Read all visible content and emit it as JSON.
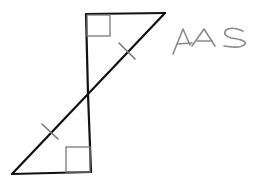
{
  "diagram": {
    "type": "two right triangles sharing a vertex (vertical angles)",
    "label": "AAS",
    "colors": {
      "edges": "#111111",
      "right_angle_marks": "#7a7a7a",
      "congruence_ticks": "#777777",
      "label": "#8a8a8a"
    },
    "triangles": [
      {
        "name": "top-triangle",
        "vertices": [
          [
            86,
            14
          ],
          [
            165,
            13
          ],
          [
            88,
            94
          ]
        ],
        "right_angle_at": [
          86,
          14
        ]
      },
      {
        "name": "bottom-triangle",
        "vertices": [
          [
            12,
            174
          ],
          [
            91,
            172
          ],
          [
            88,
            94
          ]
        ],
        "right_angle_at": [
          91,
          172
        ]
      }
    ],
    "marks": {
      "right_angles": 2,
      "congruent_hypotenuse_ticks": 2
    }
  }
}
